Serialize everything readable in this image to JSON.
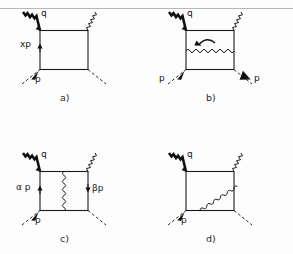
{
  "figure": {
    "background_color": "#fdfdfd",
    "ink_color": "#1a1a1a",
    "rule_color": "#b8b8b8",
    "panels": [
      {
        "id": "a",
        "caption": "a)",
        "labels": {
          "incoming_photon": "q",
          "internal_vertical": "xp",
          "incoming_parton": "p"
        },
        "description": "box loop with photon q entering top-left vertex, photon leaving top-right vertex, parton p entering bottom-left, parton leaving bottom-right, internal line momentum xp flowing upward"
      },
      {
        "id": "b",
        "caption": "b)",
        "labels": {
          "incoming_photon": "q",
          "incoming_parton_left": "p",
          "outgoing_parton_right": "p"
        },
        "description": "box loop with horizontal internal gluon line and a curved circulation arrow above it"
      },
      {
        "id": "c",
        "caption": "c)",
        "labels": {
          "incoming_photon": "q",
          "left_rail": "α p",
          "right_rail": "βp",
          "incoming_parton": "p"
        },
        "description": "box loop with vertical internal gluon line splitting the box, left rail momentum alpha p upward, right rail momentum beta p downward"
      },
      {
        "id": "d",
        "caption": "d)",
        "labels": {
          "incoming_photon": "q",
          "incoming_parton": "p"
        },
        "description": "box loop with a diagonal internal gluon line from bottom-left region to top-right corner"
      }
    ],
    "icons": {
      "photon_line": "photon-zigzag-icon",
      "gluon_line": "gluon-squiggle-icon",
      "parton_line": "dashed-parton-icon",
      "momentum_arrow": "momentum-arrow-icon",
      "circulation_arrow": "circulation-arrow-icon"
    }
  }
}
